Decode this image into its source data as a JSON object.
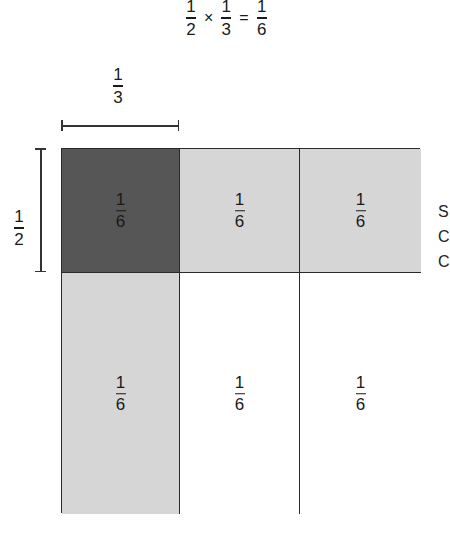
{
  "equation": {
    "left": {
      "numerator": "1",
      "denominator": "2"
    },
    "operator": "×",
    "right": {
      "numerator": "1",
      "denominator": "3"
    },
    "equals": "=",
    "result": {
      "numerator": "1",
      "denominator": "6"
    }
  },
  "width_label": {
    "numerator": "1",
    "denominator": "3"
  },
  "height_label": {
    "numerator": "1",
    "denominator": "2"
  },
  "colors": {
    "dark": "#565656",
    "light": "#d6d6d6",
    "white": "#ffffff",
    "line": "#2a2a2a"
  },
  "grid": {
    "rows": 2,
    "columns": 3,
    "cells": [
      {
        "numerator": "1",
        "denominator": "6",
        "shade": "dark"
      },
      {
        "numerator": "1",
        "denominator": "6",
        "shade": "light"
      },
      {
        "numerator": "1",
        "denominator": "6",
        "shade": "light"
      },
      {
        "numerator": "1",
        "denominator": "6",
        "shade": "light"
      },
      {
        "numerator": "1",
        "denominator": "6",
        "shade": "white"
      },
      {
        "numerator": "1",
        "denominator": "6",
        "shade": "white"
      }
    ]
  },
  "edge_cutoff_text": [
    "S",
    "C",
    "C"
  ]
}
